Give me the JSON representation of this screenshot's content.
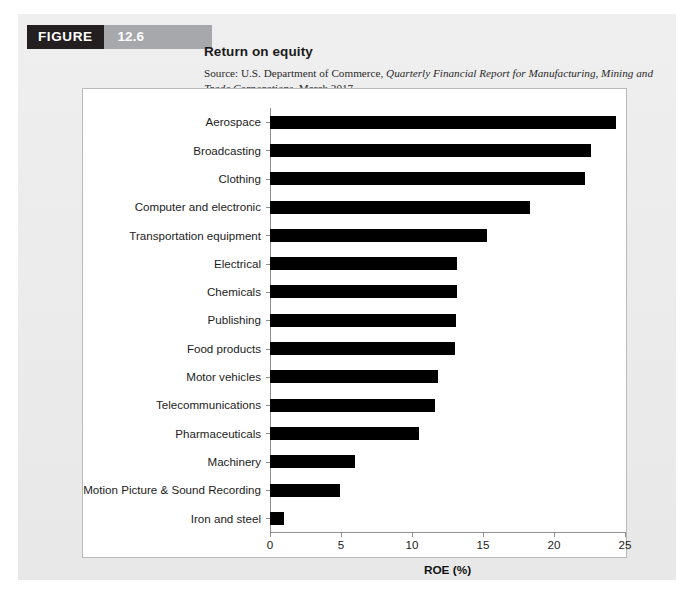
{
  "figure": {
    "badge_label": "FIGURE",
    "number": "12.6",
    "title": "Return on equity",
    "source_prefix": "Source: U.S. Department of Commerce, ",
    "source_italic": "Quarterly Financial Report for Manufacturing, Mining and Trade Corporations",
    "source_suffix": ", March 2017.",
    "badge_color": "#231f20",
    "number_block_color": "#a6a8ab",
    "panel_color": "#ededee"
  },
  "chart_data": {
    "type": "bar",
    "orientation": "horizontal",
    "title": "Return on equity",
    "xlabel": "ROE (%)",
    "ylabel": "",
    "xlim": [
      0,
      25
    ],
    "xticks": [
      0,
      5,
      10,
      15,
      20,
      25
    ],
    "xtick_labels": [
      "0",
      "5",
      "10",
      "15",
      "20",
      "25"
    ],
    "grid": false,
    "legend": null,
    "bar_color": "#000000",
    "categories": [
      "Aerospace",
      "Broadcasting",
      "Clothing",
      "Computer and electronic",
      "Transportation equipment",
      "Electrical",
      "Chemicals",
      "Publishing",
      "Food products",
      "Motor vehicles",
      "Telecommunications",
      "Pharmaceuticals",
      "Machinery",
      "Motion Picture & Sound Recording",
      "Iron and steel"
    ],
    "values": [
      24.4,
      22.6,
      22.2,
      18.3,
      15.3,
      13.2,
      13.2,
      13.1,
      13.0,
      11.8,
      11.6,
      10.5,
      6.0,
      4.9,
      1.0
    ]
  }
}
